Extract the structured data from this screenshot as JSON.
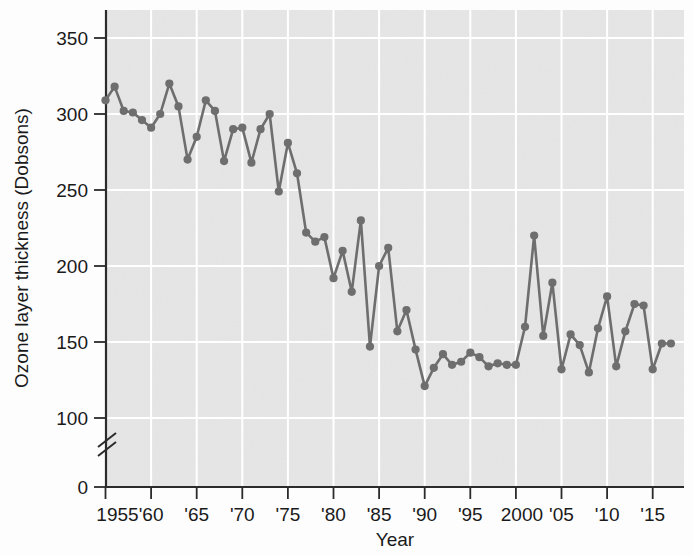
{
  "figure": {
    "background_color": "#fdfdfd",
    "plot_background_color": "#e6e6e6",
    "line_color": "#6e6e6e",
    "gridline_color": "#ffffff",
    "axis_color": "#2b2b2b"
  },
  "axes": {
    "y_title": "Ozone layer thickness (Dobsons)",
    "x_title": "Year",
    "y_ticks": [
      "0",
      "100",
      "150",
      "200",
      "250",
      "300",
      "350"
    ],
    "x_ticks": [
      "1955",
      "'60",
      "'65",
      "'70",
      "'75",
      "'80",
      "'85",
      "'90",
      "'95",
      "2000",
      "'05",
      "'10",
      "'15"
    ],
    "y_axis_break": true
  },
  "chart_data": {
    "type": "line",
    "title": "",
    "subtitle": "",
    "xlabel": "Year",
    "ylabel": "Ozone layer thickness (Dobsons)",
    "xlim": [
      1955,
      2017
    ],
    "ylim": [
      0,
      360
    ],
    "y_axis_break_between": [
      0,
      90
    ],
    "grid": true,
    "legend": "none",
    "marker": "filled-circle",
    "x": [
      1955,
      1956,
      1957,
      1958,
      1959,
      1960,
      1961,
      1962,
      1963,
      1964,
      1965,
      1966,
      1967,
      1968,
      1969,
      1970,
      1971,
      1972,
      1973,
      1974,
      1975,
      1976,
      1977,
      1978,
      1979,
      1980,
      1981,
      1982,
      1983,
      1984,
      1985,
      1986,
      1987,
      1988,
      1989,
      1990,
      1991,
      1992,
      1993,
      1994,
      1995,
      1996,
      1997,
      1998,
      1999,
      2000,
      2001,
      2002,
      2003,
      2004,
      2005,
      2006,
      2007,
      2008,
      2009,
      2010,
      2011,
      2012,
      2013,
      2014,
      2015,
      2016,
      2017
    ],
    "values": [
      309,
      318,
      302,
      301,
      296,
      291,
      300,
      320,
      305,
      270,
      285,
      309,
      302,
      269,
      290,
      291,
      268,
      290,
      300,
      249,
      281,
      261,
      222,
      216,
      219,
      192,
      210,
      183,
      230,
      147,
      200,
      212,
      157,
      171,
      145,
      121,
      133,
      142,
      135,
      137,
      143,
      140,
      134,
      136,
      135,
      135,
      160,
      220,
      154,
      189,
      132,
      155,
      148,
      130,
      159,
      180,
      134,
      157,
      175,
      174,
      132,
      149,
      149
    ],
    "series": [
      {
        "name": "Ozone layer thickness",
        "values": [
          309,
          318,
          302,
          301,
          296,
          291,
          300,
          320,
          305,
          270,
          285,
          309,
          302,
          269,
          290,
          291,
          268,
          290,
          300,
          249,
          281,
          261,
          222,
          216,
          219,
          192,
          210,
          183,
          230,
          147,
          200,
          212,
          157,
          171,
          145,
          121,
          133,
          142,
          135,
          137,
          143,
          140,
          134,
          136,
          135,
          135,
          160,
          220,
          154,
          189,
          132,
          155,
          148,
          130,
          159,
          180,
          134,
          157,
          175,
          174,
          132,
          149,
          149
        ]
      }
    ]
  }
}
